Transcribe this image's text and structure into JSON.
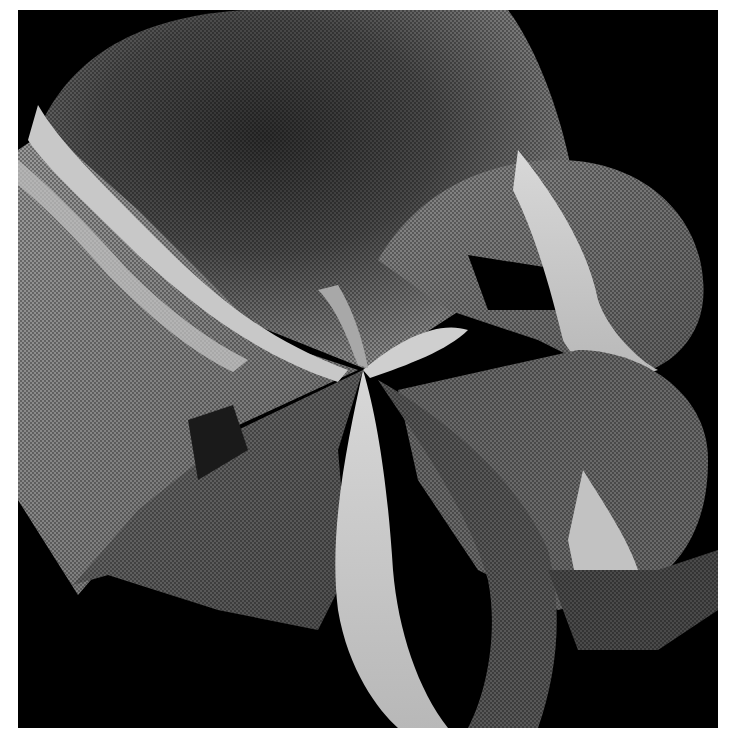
{
  "image": {
    "kind": "3D rendered self-intersecting mathematical surface",
    "rendering": "dithered grayscale",
    "background_color": "#000000",
    "margin_color": "#ffffff",
    "palette": {
      "dark": "#3a3a3a",
      "mid_dark": "#5a5a5a",
      "mid": "#7a7a7a",
      "mid_light": "#9a9a9a",
      "light": "#bdbdbd",
      "highlight": "#d6d6d6"
    }
  }
}
